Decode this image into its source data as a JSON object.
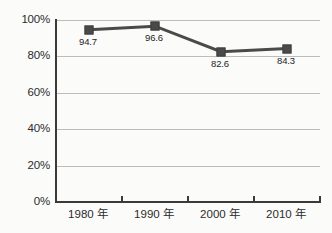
{
  "chart_data": {
    "type": "line",
    "title": "",
    "subtitle": "",
    "xlabel": "",
    "ylabel": "",
    "categories": [
      "1980 年",
      "1990 年",
      "2000 年",
      "2010 年"
    ],
    "values": [
      94.7,
      96.6,
      82.6,
      84.3
    ],
    "point_labels": [
      "94.7",
      "96.6",
      "82.6",
      "84.3"
    ],
    "series": [
      {
        "name": "",
        "values": [
          94.7,
          96.6,
          82.6,
          84.3
        ],
        "color": "#4a4a4a",
        "marker": "square"
      }
    ],
    "ylim": [
      0,
      100
    ],
    "ytick_values": [
      0,
      20,
      40,
      60,
      80,
      100
    ],
    "ytick_labels": [
      "0%",
      "20%",
      "40%",
      "60%",
      "80%",
      "100%"
    ],
    "grid": "horizontal",
    "legend": "none",
    "axis_color": "#3a3a3a",
    "grid_color": "#bcbcbc",
    "background_color": "#fbfbfa",
    "label_color": "#232323"
  }
}
